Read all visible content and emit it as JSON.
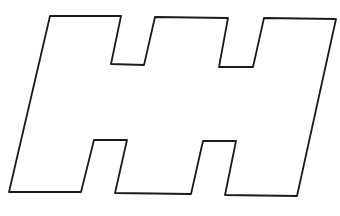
{
  "figure": {
    "stroke_color": "#1a1a1a",
    "fill_color": "#ffffff",
    "stroke_width": 1.8,
    "points": "50,16 121,16 111,64 144,65 155,17 228,18 219,67 253,67 264,18 336,19 297,196 225,195 236,141 203,141 191,194 115,193 127,140 94,140 81,192 9,192"
  }
}
